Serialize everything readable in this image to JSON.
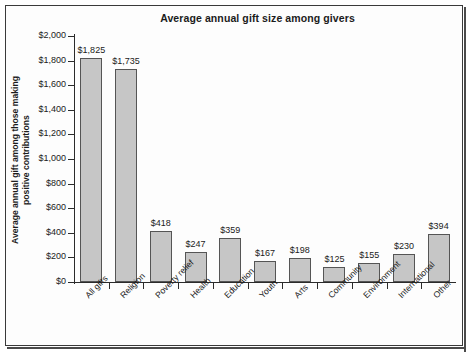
{
  "chart_data": {
    "type": "bar",
    "title": "Average annual gift size among givers",
    "xlabel": "",
    "ylabel": "Average annual gift among those making positive contributions",
    "ylabel_lines": [
      "Average annual gift among those making",
      "positive contributions"
    ],
    "categories": [
      "All gifts",
      "Religion",
      "Poverty relief",
      "Health",
      "Education",
      "Youth",
      "Arts",
      "Community",
      "Environment",
      "International",
      "Other"
    ],
    "values": [
      1825,
      1735,
      418,
      247,
      359,
      167,
      198,
      125,
      155,
      230,
      394
    ],
    "value_labels": [
      "$1,825",
      "$1,735",
      "$418",
      "$247",
      "$359",
      "$167",
      "$198",
      "$125",
      "$155",
      "$230",
      "$394"
    ],
    "ylim": [
      0,
      2000
    ],
    "ytick_values": [
      0,
      200,
      400,
      600,
      800,
      1000,
      1200,
      1400,
      1600,
      1800,
      2000
    ],
    "ytick_labels": [
      "$0",
      "$200",
      "$400",
      "$600",
      "$800",
      "$1,000",
      "$1,200",
      "$1,400",
      "$1,600",
      "$1,800",
      "$2,000"
    ],
    "grid": false,
    "legend": null,
    "bar_color": "#c6c6c6",
    "bar_edge_color": "#555555",
    "axis_color": "#2b2b2b",
    "text_color": "#1b1b1b",
    "background_color": "#ffffff",
    "frame_color": "#3a3a3a",
    "x_label_rotation": -45
  }
}
